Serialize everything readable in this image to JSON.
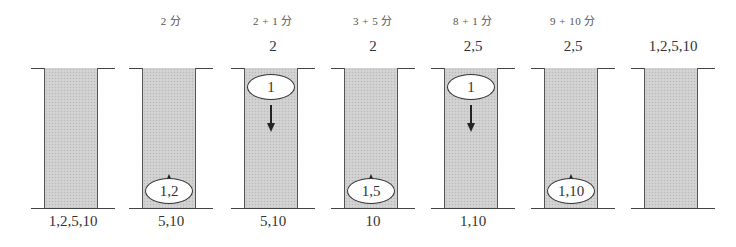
{
  "diagram": {
    "colors": {
      "bridge_fill": "#cfcfcf",
      "line": "#444444",
      "text": "#333333",
      "oval_fill": "#ffffff"
    },
    "panels": [
      {
        "time_label": "",
        "far_side": "",
        "near_side": "1,2,5,10",
        "oval": "",
        "oval_position": "none",
        "arrow": "none"
      },
      {
        "time_label": "2 分",
        "far_side": "",
        "near_side": "5,10",
        "oval": "1,2",
        "oval_position": "bottom",
        "arrow": "up"
      },
      {
        "time_label": "2 + 1 分",
        "far_side": "2",
        "near_side": "5,10",
        "oval": "1",
        "oval_position": "top",
        "arrow": "down"
      },
      {
        "time_label": "3 + 5 分",
        "far_side": "2",
        "near_side": "10",
        "oval": "1,5",
        "oval_position": "bottom",
        "arrow": "up"
      },
      {
        "time_label": "8 + 1 分",
        "far_side": "2,5",
        "near_side": "1,10",
        "oval": "1",
        "oval_position": "top",
        "arrow": "down"
      },
      {
        "time_label": "9 + 10 分",
        "far_side": "2,5",
        "near_side": "",
        "oval": "1,10",
        "oval_position": "bottom",
        "arrow": "up"
      },
      {
        "time_label": "",
        "far_side": "1,2,5,10",
        "near_side": "",
        "oval": "",
        "oval_position": "none",
        "arrow": "none"
      }
    ]
  }
}
